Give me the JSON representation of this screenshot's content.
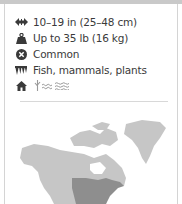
{
  "facts": [
    {
      "icon": "length-arrows-icon",
      "text": "10–19 in (25–48 cm)"
    },
    {
      "icon": "weight-icon",
      "text": "Up to 35 lb (16 kg)"
    },
    {
      "icon": "status-common-icon",
      "text": "Common"
    },
    {
      "icon": "diet-teeth-icon",
      "text": "Fish, mammals, plants"
    },
    {
      "icon": "habitat-home-icon",
      "text": ""
    }
  ],
  "habitat_icons": [
    "grassland-icon",
    "water-icon",
    "wetland-icon"
  ],
  "map": {
    "region": "North America range map",
    "land_color": "#c6c6c6",
    "range_color": "#8e8e8e"
  },
  "colors": {
    "text": "#3a3a3a",
    "icon": "#3a3a3a",
    "divider": "#d8d8d8",
    "topbar": "#c9c9c9"
  }
}
